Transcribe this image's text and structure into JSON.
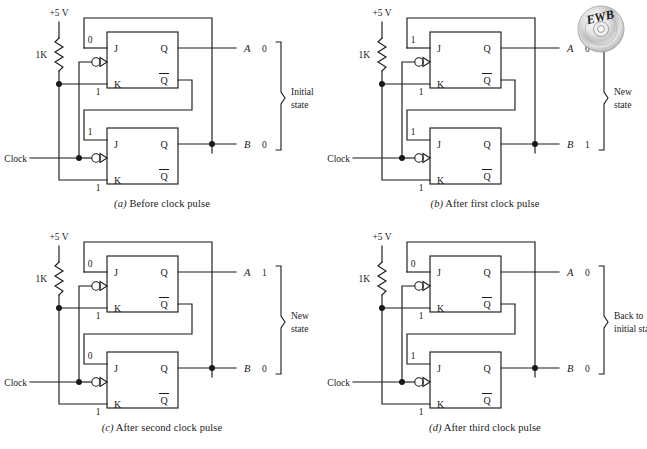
{
  "figure": {
    "type": "jk-flip-flop-ripple-counter-states",
    "logo": {
      "name": "ewb-cd-logo",
      "text": "EWB"
    }
  },
  "labels": {
    "supply": "+5 V",
    "resistor": "1K",
    "clock": "Clock",
    "j": "J",
    "k": "K",
    "q": "Q",
    "qbar": "Q",
    "out_a": "A",
    "out_b": "B"
  },
  "panels": [
    {
      "id": "a",
      "caption_letter": "(a)",
      "caption_text": "Before clock pulse",
      "top_ff": {
        "j": "0",
        "k": "1"
      },
      "bottom_ff": {
        "j": "1",
        "k": "1"
      },
      "out_a_value": "0",
      "out_b_value": "0",
      "state_note": [
        "Initial",
        "state"
      ]
    },
    {
      "id": "b",
      "caption_letter": "(b)",
      "caption_text": "After first clock pulse",
      "top_ff": {
        "j": "1",
        "k": "1"
      },
      "bottom_ff": {
        "j": "1",
        "k": "1"
      },
      "out_a_value": "0",
      "out_b_value": "1",
      "state_note": [
        "New",
        "state"
      ]
    },
    {
      "id": "c",
      "caption_letter": "(c)",
      "caption_text": "After second clock pulse",
      "top_ff": {
        "j": "0",
        "k": "1"
      },
      "bottom_ff": {
        "j": "0",
        "k": "1"
      },
      "out_a_value": "1",
      "out_b_value": "0",
      "state_note": [
        "New",
        "state"
      ]
    },
    {
      "id": "d",
      "caption_letter": "(d)",
      "caption_text": "After third clock pulse",
      "top_ff": {
        "j": "0",
        "k": "1"
      },
      "bottom_ff": {
        "1": "1",
        "j": "1",
        "k": "1"
      },
      "out_a_value": "0",
      "out_b_value": "0",
      "state_note": [
        "Back to",
        "initial state"
      ]
    }
  ]
}
